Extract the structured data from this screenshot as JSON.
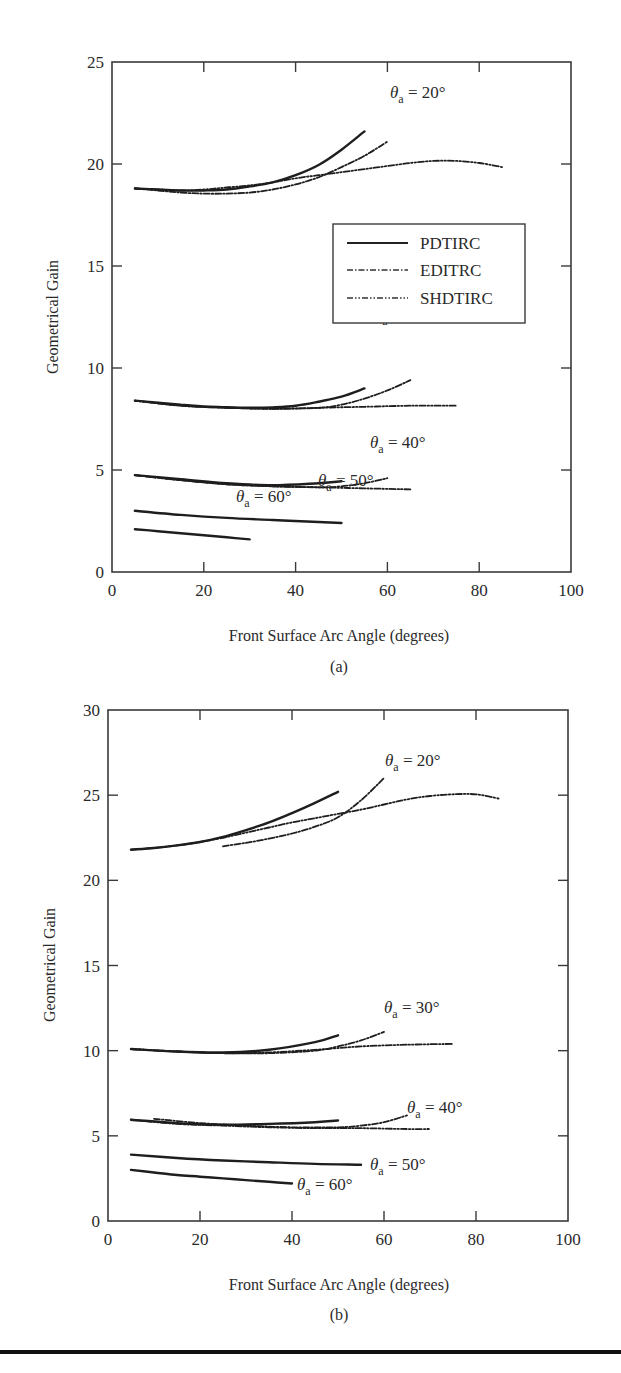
{
  "chart_data": [
    {
      "type": "line",
      "panel": "a",
      "caption": "(a)",
      "xlabel": "Front Surface Arc Angle (degrees)",
      "ylabel": "Geometrical Gain",
      "xlim": [
        0,
        100
      ],
      "ylim": [
        0,
        25
      ],
      "xticks": [
        0,
        20,
        40,
        60,
        80,
        100
      ],
      "yticks": [
        0,
        5,
        10,
        15,
        20,
        25
      ],
      "grid": false,
      "legend": {
        "placement": "center-right",
        "entries": [
          {
            "name": "PDTIRC",
            "style": "solid"
          },
          {
            "name": "EDITRC",
            "style": "dash-dot"
          },
          {
            "name": "SHDTIRC",
            "style": "dash-dot-dot"
          }
        ]
      },
      "groups": [
        {
          "annotation": {
            "theta": "θ",
            "sub": "a",
            "text": " = 20°"
          },
          "series": [
            {
              "name": "PDTIRC",
              "x": [
                5,
                10,
                15,
                20,
                25,
                30,
                35,
                40,
                45,
                50,
                55
              ],
              "y": [
                18.8,
                18.75,
                18.7,
                18.7,
                18.75,
                18.9,
                19.1,
                19.45,
                19.95,
                20.7,
                21.6
              ]
            },
            {
              "name": "EDITRC",
              "x": [
                5,
                10,
                15,
                20,
                25,
                30,
                35,
                40,
                45,
                50,
                55,
                60
              ],
              "y": [
                18.8,
                18.7,
                18.6,
                18.55,
                18.55,
                18.6,
                18.75,
                19.0,
                19.35,
                19.85,
                20.4,
                21.1
              ]
            },
            {
              "name": "SHDTIRC",
              "x": [
                5,
                10,
                15,
                20,
                25,
                30,
                35,
                40,
                45,
                50,
                55,
                60,
                65,
                70,
                75,
                80,
                85
              ],
              "y": [
                18.8,
                18.75,
                18.7,
                18.75,
                18.85,
                18.95,
                19.1,
                19.3,
                19.45,
                19.6,
                19.75,
                19.9,
                20.05,
                20.15,
                20.15,
                20.05,
                19.85
              ]
            }
          ]
        },
        {
          "annotation": {
            "theta": "θ",
            "sub": "a",
            "text": " = 30°"
          },
          "series": [
            {
              "name": "PDTIRC",
              "x": [
                5,
                10,
                15,
                20,
                25,
                30,
                35,
                40,
                45,
                50,
                55
              ],
              "y": [
                8.4,
                8.3,
                8.2,
                8.12,
                8.08,
                8.05,
                8.07,
                8.15,
                8.35,
                8.6,
                9.0
              ]
            },
            {
              "name": "EDITRC",
              "x": [
                5,
                15,
                25,
                35,
                45,
                50,
                55,
                60,
                65
              ],
              "y": [
                8.4,
                8.15,
                8.05,
                8.0,
                8.05,
                8.2,
                8.5,
                8.9,
                9.4
              ]
            },
            {
              "name": "SHDTIRC",
              "x": [
                5,
                15,
                25,
                35,
                45,
                55,
                65,
                75
              ],
              "y": [
                8.4,
                8.15,
                8.05,
                8.0,
                8.05,
                8.1,
                8.15,
                8.15
              ]
            }
          ]
        },
        {
          "annotation": {
            "theta": "θ",
            "sub": "a",
            "text": " = 40°"
          },
          "series": [
            {
              "name": "PDTIRC",
              "x": [
                5,
                15,
                25,
                35,
                45,
                50
              ],
              "y": [
                4.75,
                4.55,
                4.35,
                4.25,
                4.35,
                4.45
              ]
            },
            {
              "name": "EDITRC",
              "x": [
                5,
                15,
                25,
                35,
                45,
                50,
                55,
                60
              ],
              "y": [
                4.75,
                4.5,
                4.3,
                4.2,
                4.15,
                4.2,
                4.35,
                4.6
              ]
            },
            {
              "name": "SHDTIRC",
              "x": [
                5,
                15,
                25,
                35,
                45,
                55,
                65
              ],
              "y": [
                4.75,
                4.5,
                4.3,
                4.2,
                4.15,
                4.1,
                4.05
              ]
            }
          ]
        },
        {
          "annotation": {
            "theta": "θ",
            "sub": "a",
            "text": " = 50°"
          },
          "series": [
            {
              "name": "PDTIRC",
              "x": [
                5,
                15,
                25,
                35,
                45,
                50
              ],
              "y": [
                3.0,
                2.8,
                2.65,
                2.55,
                2.45,
                2.4
              ]
            }
          ]
        },
        {
          "annotation": {
            "theta": "θ",
            "sub": "a",
            "text": " = 60°"
          },
          "series": [
            {
              "name": "PDTIRC",
              "x": [
                5,
                10,
                15,
                20,
                25,
                30
              ],
              "y": [
                2.1,
                2.0,
                1.9,
                1.8,
                1.7,
                1.6
              ]
            }
          ]
        }
      ]
    },
    {
      "type": "line",
      "panel": "b",
      "caption": "(b)",
      "xlabel": "Front Surface Arc Angle (degrees)",
      "ylabel": "Geometrical Gain",
      "xlim": [
        0,
        100
      ],
      "ylim": [
        0,
        30
      ],
      "xticks": [
        0,
        20,
        40,
        60,
        80,
        100
      ],
      "yticks": [
        0,
        5,
        10,
        15,
        20,
        25,
        30
      ],
      "grid": false,
      "groups": [
        {
          "annotation": {
            "theta": "θ",
            "sub": "a",
            "text": " = 20°"
          },
          "series": [
            {
              "name": "PDTIRC",
              "x": [
                5,
                10,
                15,
                20,
                25,
                30,
                35,
                40,
                45,
                50
              ],
              "y": [
                21.8,
                21.9,
                22.05,
                22.25,
                22.55,
                22.95,
                23.4,
                23.95,
                24.55,
                25.2
              ]
            },
            {
              "name": "EDITRC",
              "x": [
                25,
                30,
                35,
                40,
                45,
                50,
                55,
                60
              ],
              "y": [
                22.0,
                22.2,
                22.45,
                22.75,
                23.15,
                23.7,
                24.7,
                26.0
              ]
            },
            {
              "name": "SHDTIRC",
              "x": [
                5,
                10,
                15,
                20,
                25,
                30,
                35,
                40,
                45,
                50,
                55,
                60,
                65,
                70,
                75,
                80,
                85
              ],
              "y": [
                21.8,
                21.9,
                22.05,
                22.25,
                22.5,
                22.8,
                23.1,
                23.4,
                23.65,
                23.9,
                24.15,
                24.45,
                24.75,
                24.95,
                25.05,
                25.05,
                24.8
              ]
            }
          ]
        },
        {
          "annotation": {
            "theta": "θ",
            "sub": "a",
            "text": " = 30°"
          },
          "series": [
            {
              "name": "PDTIRC",
              "x": [
                5,
                15,
                25,
                35,
                45,
                50
              ],
              "y": [
                10.1,
                9.95,
                9.9,
                10.05,
                10.5,
                10.9
              ]
            },
            {
              "name": "EDITRC",
              "x": [
                5,
                15,
                25,
                35,
                45,
                50,
                55,
                60
              ],
              "y": [
                10.1,
                9.95,
                9.85,
                9.85,
                10.0,
                10.25,
                10.6,
                11.1
              ]
            },
            {
              "name": "SHDTIRC",
              "x": [
                5,
                15,
                25,
                35,
                45,
                55,
                65,
                75
              ],
              "y": [
                10.1,
                9.95,
                9.85,
                9.9,
                10.05,
                10.25,
                10.35,
                10.4
              ]
            }
          ]
        },
        {
          "annotation": {
            "theta": "θ",
            "sub": "a",
            "text": " = 40°"
          },
          "series": [
            {
              "name": "PDTIRC",
              "x": [
                5,
                15,
                25,
                35,
                45,
                50
              ],
              "y": [
                5.95,
                5.75,
                5.65,
                5.7,
                5.8,
                5.9
              ]
            },
            {
              "name": "EDITRC",
              "x": [
                10,
                20,
                30,
                40,
                50,
                55,
                60,
                65
              ],
              "y": [
                6.0,
                5.75,
                5.6,
                5.5,
                5.5,
                5.6,
                5.8,
                6.2
              ]
            },
            {
              "name": "SHDTIRC",
              "x": [
                5,
                15,
                25,
                35,
                45,
                55,
                65,
                70
              ],
              "y": [
                5.95,
                5.7,
                5.6,
                5.5,
                5.45,
                5.45,
                5.4,
                5.4
              ]
            }
          ]
        },
        {
          "annotation": {
            "theta": "θ",
            "sub": "a",
            "text": " = 50°"
          },
          "series": [
            {
              "name": "PDTIRC",
              "x": [
                5,
                15,
                25,
                35,
                45,
                55
              ],
              "y": [
                3.9,
                3.7,
                3.55,
                3.45,
                3.35,
                3.3
              ]
            }
          ]
        },
        {
          "annotation": {
            "theta": "θ",
            "sub": "a",
            "text": " = 60°"
          },
          "series": [
            {
              "name": "PDTIRC",
              "x": [
                5,
                10,
                15,
                20,
                25,
                30,
                35,
                40
              ],
              "y": [
                3.0,
                2.85,
                2.7,
                2.6,
                2.5,
                2.4,
                2.3,
                2.2
              ]
            }
          ]
        }
      ]
    }
  ]
}
